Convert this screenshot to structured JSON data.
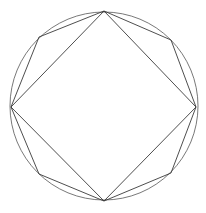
{
  "figure": {
    "width": 206,
    "height": 213,
    "colors": {
      "background": "#ffffff",
      "lines": "#3a3a3a",
      "circle": "#555555"
    },
    "circle": {
      "cx": 104,
      "cy": 106,
      "r": 94
    },
    "square": {
      "points": [
        [
          104,
          11
        ],
        [
          196,
          107
        ],
        [
          104,
          201
        ],
        [
          11,
          107
        ]
      ]
    },
    "octagon": {
      "points": [
        [
          104,
          11
        ],
        [
          171,
          40
        ],
        [
          196,
          107
        ],
        [
          171,
          173
        ],
        [
          104,
          201
        ],
        [
          39,
          174
        ],
        [
          11,
          107
        ],
        [
          39,
          37
        ]
      ]
    }
  }
}
